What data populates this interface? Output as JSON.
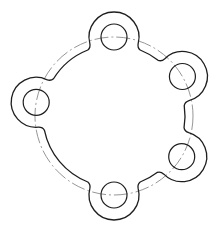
{
  "drawing": {
    "type": "flange-plate-top-view",
    "colors": {
      "outline": "#1e1e1e",
      "centerline": "#8a8a8a",
      "background": "#ffffff"
    },
    "center": [
      114,
      116
    ],
    "pitch_circle_radius": 79,
    "body_radius": 71,
    "lug_outer_radius": 25,
    "hole_radius": 13,
    "fillet": 6,
    "holes": [
      {
        "name": "top",
        "angle_deg": -90
      },
      {
        "name": "upper-right",
        "angle_deg": -30
      },
      {
        "name": "lower-right",
        "angle_deg": 31
      },
      {
        "name": "bottom",
        "angle_deg": 90
      },
      {
        "name": "left",
        "angle_deg": 190
      }
    ]
  }
}
